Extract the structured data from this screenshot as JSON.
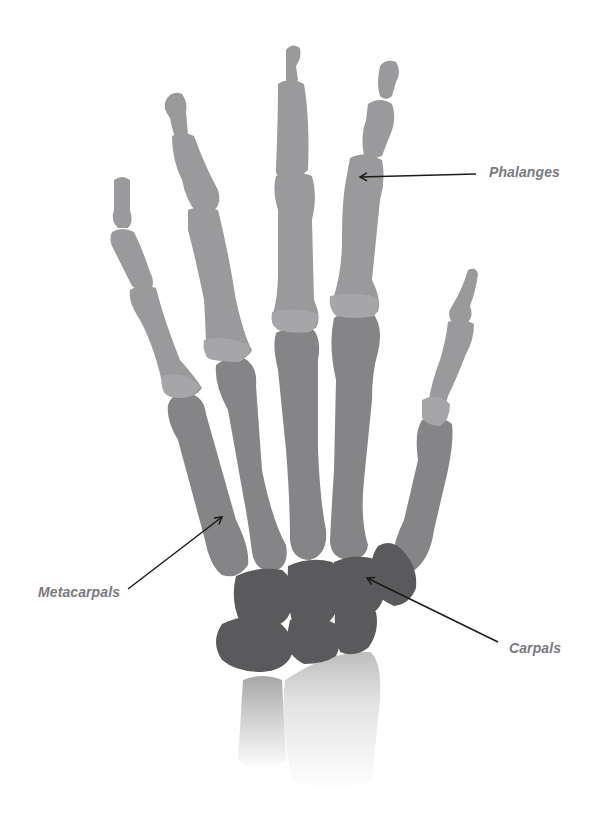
{
  "diagram": {
    "colors": {
      "background": "#ffffff",
      "phalanges": "#9a9a9c",
      "metacarpals": "#858587",
      "carpals": "#5a5a5c",
      "forearm": "#cfcfcf",
      "label": "#7a7a7e",
      "arrow": "#1a1a1a"
    },
    "labels": [
      {
        "id": "phalanges",
        "text": "Phalanges"
      },
      {
        "id": "metacarpals",
        "text": "Metacarpals"
      },
      {
        "id": "carpals",
        "text": "Carpals"
      }
    ]
  }
}
